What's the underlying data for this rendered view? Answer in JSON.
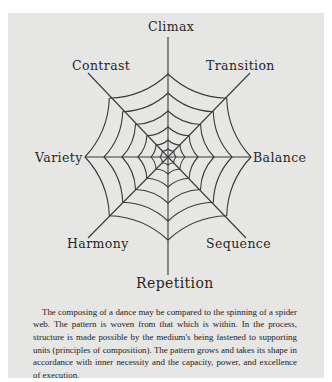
{
  "diagram": {
    "type": "spider-web",
    "center": [
      168,
      157
    ],
    "spokes": [
      {
        "label": "Climax",
        "angle": -90
      },
      {
        "label": "Transition",
        "angle": -45
      },
      {
        "label": "Balance",
        "angle": 0
      },
      {
        "label": "Sequence",
        "angle": 45
      },
      {
        "label": "Repetition",
        "angle": 90
      },
      {
        "label": "Harmony",
        "angle": 135
      },
      {
        "label": "Variety",
        "angle": 180
      },
      {
        "label": "Contrast",
        "angle": -135
      }
    ],
    "labels": {
      "climax": "Climax",
      "transition": "Transition",
      "balance": "Balance",
      "sequence": "Sequence",
      "repetition": "Repetition",
      "harmony": "Harmony",
      "variety": "Variety",
      "contrast": "Contrast"
    },
    "ring_radii": [
      83,
      64,
      46,
      30,
      17,
      8
    ],
    "line_color": "#3a3a3a",
    "background_color": "#e6e6e4"
  },
  "caption": {
    "text": "The composing of a dance may be compared to the spinning of a spider web. The pattern is woven from that which is within. In the process, structure is made possible by the medium's being fastened to supporting units (principles of composition). The pattern grows and takes its shape in accordance with inner necessity and the capacity, power, and excellence of execution."
  }
}
